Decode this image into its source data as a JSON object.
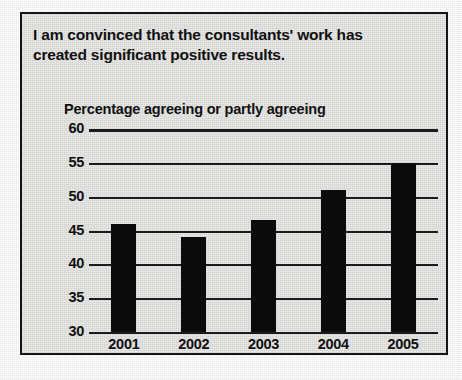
{
  "chart_data": {
    "type": "bar",
    "title": "I am convinced that the consultants' work has created significant positive results.",
    "title_line1": "I am convinced that the consultants' work has",
    "title_line2": "created significant positive results.",
    "subtitle": "Percentage agreeing or partly agreeing",
    "xlabel": "",
    "ylabel": "",
    "categories": [
      "2001",
      "2002",
      "2003",
      "2004",
      "2005"
    ],
    "values": [
      46,
      44,
      46.5,
      51,
      55
    ],
    "ylim": [
      30,
      60
    ],
    "ytick_step": 5,
    "yticks": [
      "60",
      "55",
      "50",
      "45",
      "40",
      "35",
      "30"
    ],
    "grid": true,
    "legend": "none",
    "bar_color": "#0b0b0b",
    "axis_color": "#1b1b1b",
    "panel_background": "#e9e9e7"
  }
}
